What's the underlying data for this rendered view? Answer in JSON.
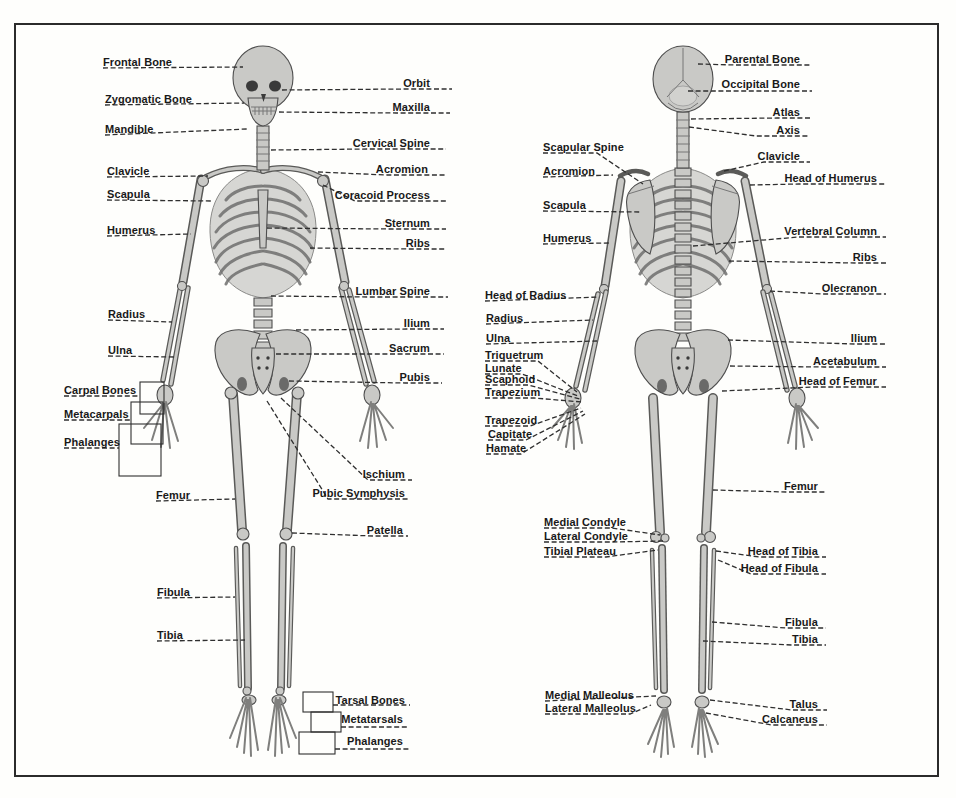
{
  "figure": {
    "views": {
      "anterior": {
        "labels_left": [
          "Frontal Bone",
          "Zygomatic Bone",
          "Mandible",
          "Clavicle",
          "Scapula",
          "Humerus",
          "Radius",
          "Ulna",
          "Carpal Bones",
          "Metacarpals",
          "Phalanges",
          "Femur",
          "Fibula",
          "Tibia"
        ],
        "labels_right": [
          "Orbit",
          "Maxilla",
          "Cervical Spine",
          "Acromion",
          "Coracoid Process",
          "Sternum",
          "Ribs",
          "Lumbar Spine",
          "Ilium",
          "Sacrum",
          "Pubis",
          "Ischium",
          "Pubic Symphysis",
          "Patella",
          "Tarsal Bones",
          "Metatarsals",
          "Phalanges"
        ]
      },
      "posterior": {
        "labels_left": [
          "Scapular Spine",
          "Acromion",
          "Scapula",
          "Humerus",
          "Head of Radius",
          "Radius",
          "Ulna",
          "Triquetrum",
          "Lunate",
          "Scaphoid",
          "Trapezium",
          "Trapezoid",
          "Capitate",
          "Hamate",
          "Medial Condyle",
          "Lateral Condyle",
          "Tibial Plateau",
          "Medial Malleolus",
          "Lateral Malleolus"
        ],
        "labels_right": [
          "Parental Bone",
          "Occipital Bone",
          "Atlas",
          "Axis",
          "Clavicle",
          "Head of Humerus",
          "Vertebral Column",
          "Ribs",
          "Olecranon",
          "Ilium",
          "Acetabulum",
          "Head of Femur",
          "Femur",
          "Head of Tibia",
          "Head of Fibula",
          "Fibula",
          "Tibia",
          "Talus",
          "Calcaneus"
        ]
      }
    },
    "colors": {
      "background": "#fefefc",
      "frame": "#2b2b2b",
      "bone_fill": "#c9c9c6",
      "bone_outline": "#4e4e4e",
      "leader_line": "#2f2f2f",
      "label_text": "#191919"
    }
  }
}
